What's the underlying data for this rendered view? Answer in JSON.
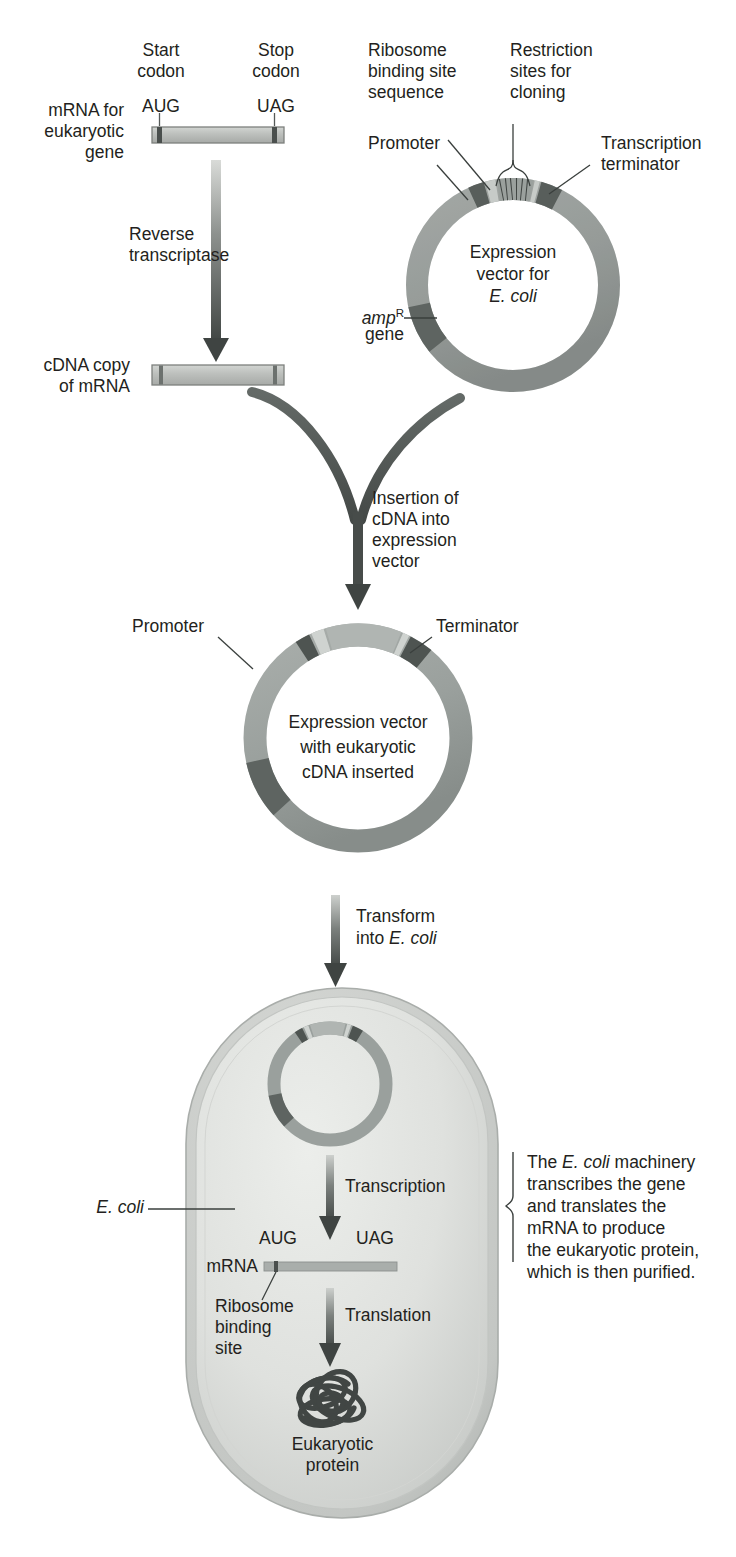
{
  "figure": {
    "domain": "molecular-biology-diagram"
  },
  "palette": {
    "ink": "#231f20",
    "ring_light": "#b9bdba",
    "ring_mid": "#9aa09d",
    "ring_dark": "#6f7673",
    "ring_darkest": "#4a4f4d",
    "insert_light": "#cfd3d0",
    "bar_fill": "#b7bab7",
    "bar_edge": "#7d807d",
    "arrow": "#4f5452",
    "cell_fill": "#dcdedb",
    "cell_edge": "#a9adaa",
    "protein": "#4a4f4d"
  },
  "step1": {
    "left_label": "mRNA for\neukaryotic\ngene",
    "start_codon_label": "Start\ncodon",
    "start_codon": "AUG",
    "stop_codon_label": "Stop\ncodon",
    "stop_codon": "UAG"
  },
  "step2": {
    "arrow_label": "Reverse\ntranscriptase",
    "product_label": "cDNA copy\nof mRNA"
  },
  "vector_top": {
    "center_line1": "Expression",
    "center_line2": "vector for",
    "center_line3": "E. coli",
    "labels": {
      "ribosome_binding": "Ribosome\nbinding site\nsequence",
      "promoter": "Promoter",
      "restriction_sites": "Restriction\nsites for\ncloning",
      "transcription_terminator": "Transcription\nterminator",
      "amp_gene_prefix": "amp",
      "amp_gene_sup": "R",
      "amp_gene_suffix": "gene"
    }
  },
  "step3": {
    "arrow_label": "Insertion of\ncDNA into\nexpression\nvector"
  },
  "vector_mid": {
    "center_line1": "Expression vector",
    "center_line2": "with eukaryotic",
    "center_line3": "cDNA inserted",
    "labels": {
      "promoter": "Promoter",
      "terminator": "Terminator"
    }
  },
  "step4": {
    "arrow_label_line1": "Transform",
    "arrow_label_line2_prefix": "into ",
    "arrow_label_line2_ital": "E. coli"
  },
  "cell": {
    "label_ital": "E. coli",
    "transcription": "Transcription",
    "translation": "Translation",
    "mrna_label": "mRNA",
    "start_codon": "AUG",
    "stop_codon": "UAG",
    "rbs_label": "Ribosome\nbinding\nsite",
    "protein_label": "Eukaryotic\nprotein"
  },
  "annotation": {
    "line1_prefix": "The ",
    "line1_ital": "E. coli",
    "line1_suffix": " machinery",
    "line2": "transcribes the gene",
    "line3": "and translates the",
    "line4": "mRNA to produce",
    "line5": "the eukaryotic protein,",
    "line6": "which is then purified."
  }
}
